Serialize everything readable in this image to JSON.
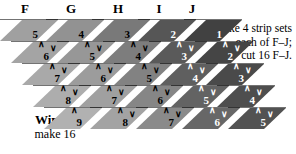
{
  "headers": [
    {
      "label": "F",
      "x": 16
    },
    {
      "label": "G",
      "x": 62
    },
    {
      "label": "H",
      "x": 109
    },
    {
      "label": "I",
      "x": 150
    },
    {
      "label": "J",
      "x": 183
    }
  ],
  "grid": {
    "rows": 5,
    "cols": 5,
    "row_step_x": 11,
    "row_step_y": 22,
    "col_step_x": 46,
    "shades": [
      "#a8a8a8",
      "#949494",
      "#6e6e6e",
      "#3b3b3b",
      "#1c1c1c"
    ],
    "row_shade_lighten": [
      "#8f8f8f",
      "#9c9c9c",
      "#acacac",
      "#b8b8b8",
      "#c4c4c4"
    ],
    "chevron_down": "∨",
    "chevron_up": "∧",
    "cells": [
      [
        {
          "n": "5"
        },
        {
          "n": "4"
        },
        {
          "n": "3"
        },
        {
          "n": "2"
        },
        {
          "n": "1"
        }
      ],
      [
        {
          "n": "6"
        },
        {
          "n": "5"
        },
        {
          "n": "4"
        },
        {
          "n": "3"
        },
        {
          "n": "2"
        }
      ],
      [
        {
          "n": "7"
        },
        {
          "n": "6"
        },
        {
          "n": "5"
        },
        {
          "n": "4"
        },
        {
          "n": "3"
        }
      ],
      [
        {
          "n": "8"
        },
        {
          "n": "7"
        },
        {
          "n": "6"
        },
        {
          "n": "5"
        },
        {
          "n": "4"
        }
      ],
      [
        {
          "n": "9"
        },
        {
          "n": "8"
        },
        {
          "n": "7"
        },
        {
          "n": "6"
        },
        {
          "n": "5"
        }
      ]
    ]
  },
  "note": {
    "line1": "Make 4 strip sets",
    "line2": "each of F–J;",
    "line3": "cut 16 F–J."
  },
  "label": {
    "name": "Wintry",
    "quantity": "make 16"
  }
}
